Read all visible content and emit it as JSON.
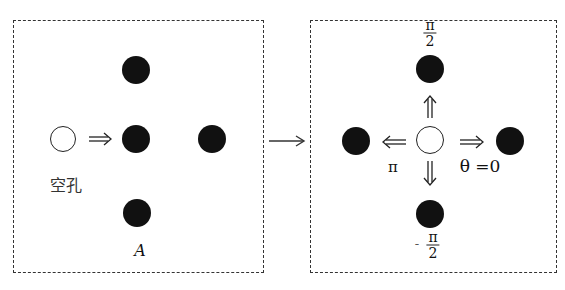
{
  "left_panel": {
    "hole_label": "空孔",
    "atom_label": "A"
  },
  "transition_arrow": "→",
  "right_panel": {
    "angle_up": {
      "num": "π",
      "den": "2"
    },
    "angle_down": {
      "num": "π",
      "den": "2",
      "sign": "-"
    },
    "angle_left": "π",
    "angle_right": "θ =0"
  },
  "colors": {
    "atom": "#111111",
    "hole_fill": "#ffffff",
    "border": "#333333"
  }
}
